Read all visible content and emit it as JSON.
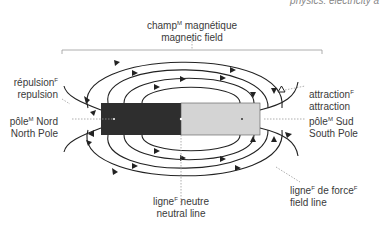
{
  "header": {
    "title": "physics: electricity a"
  },
  "labels": {
    "magnetic_field": {
      "fr": "champ",
      "fr_gender": "M",
      "fr_rest": " magnétique",
      "en": "magnetic field"
    },
    "repulsion": {
      "fr": "répulsion",
      "fr_gender": "F",
      "en": "repulsion"
    },
    "north_pole": {
      "fr": "pôle",
      "fr_gender": "M",
      "fr_rest": " Nord",
      "en": "North Pole"
    },
    "attraction": {
      "fr": "attraction",
      "fr_gender": "F",
      "en": "attraction"
    },
    "south_pole": {
      "fr": "pôle",
      "fr_gender": "M",
      "fr_rest": " Sud",
      "en": "South Pole"
    },
    "neutral_line": {
      "fr": "ligne",
      "fr_gender": "F",
      "fr_rest": " neutre",
      "en": "neutral line"
    },
    "field_line": {
      "fr": "ligne",
      "fr_gender": "F",
      "fr_rest": " de force",
      "fr_gender2": "F",
      "en": "field line"
    }
  },
  "colors": {
    "north_pole_fill": "#2e2e2e",
    "south_pole_fill": "#d4d4d4",
    "line": "#222222",
    "leader": "#999999"
  }
}
